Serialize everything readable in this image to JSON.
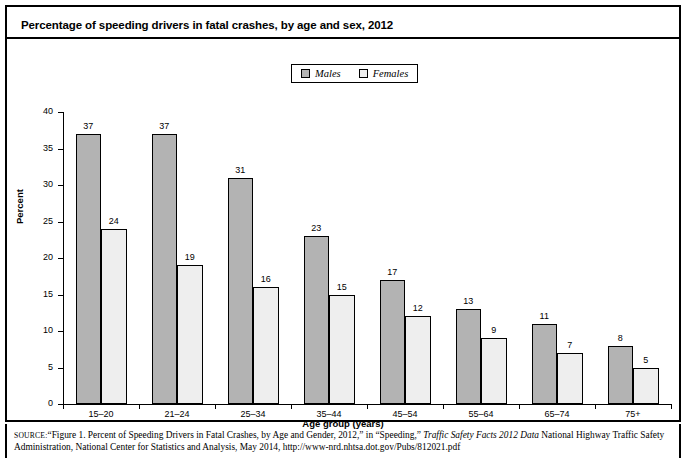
{
  "figure": {
    "title": "Percentage of speeding drivers in fatal crashes, by age and sex, 2012"
  },
  "legend": {
    "position": "top-center",
    "entries": [
      {
        "label": "Males",
        "color": "#b3b3b3"
      },
      {
        "label": "Females",
        "color": "#eeeeee"
      }
    ]
  },
  "source": {
    "label": "SOURCE:",
    "text_part1": "“Figure 1. Percent of Speeding Drivers in Fatal Crashes, by Age and Gender, 2012,” in “Speeding,” ",
    "italic_title": "Traffic Safety Facts 2012 Data",
    "text_part2": " National Highway Traffic Safety Administration, National Center for Statistics and Analysis, May 2014, http://www-nrd.nhtsa.dot.gov/Pubs/812021.pdf"
  },
  "chart_data": {
    "type": "bar",
    "title": "Percentage of speeding drivers in fatal crashes, by age and sex, 2012",
    "xlabel": "Age group (years)",
    "ylabel": "Percent",
    "categories": [
      "15–20",
      "21–24",
      "25–34",
      "35–44",
      "45–54",
      "55–64",
      "65–74",
      "75+"
    ],
    "series": [
      {
        "name": "Males",
        "color": "#b3b3b3",
        "values": [
          37,
          37,
          31,
          23,
          17,
          13,
          11,
          8
        ]
      },
      {
        "name": "Females",
        "color": "#eeeeee",
        "values": [
          24,
          19,
          16,
          15,
          12,
          9,
          7,
          5
        ]
      }
    ],
    "ylim": [
      0,
      40
    ],
    "yticks": [
      0,
      5,
      10,
      15,
      20,
      25,
      30,
      35,
      40
    ],
    "grid": false,
    "legend_position": "top-center",
    "data_labels": true
  }
}
